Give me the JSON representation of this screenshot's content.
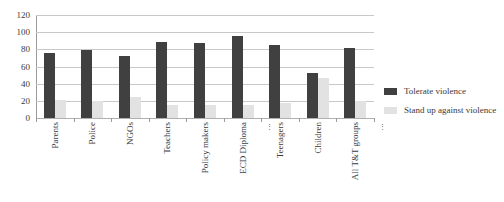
{
  "chart_data": {
    "type": "bar",
    "title": "",
    "subtitle": "",
    "xlabel": "",
    "ylabel": "",
    "ylim": [
      0,
      120
    ],
    "yticks": [
      0,
      20,
      40,
      60,
      80,
      100,
      120
    ],
    "grid": true,
    "legend_position": "right",
    "categories": [
      "Parents",
      "Police",
      "NGOs",
      "Teachers",
      "Policy makers",
      "ECD Diploma",
      "Teenagers",
      "Children",
      "All T&T groups"
    ],
    "category_marks": [
      "",
      "",
      "",
      "",
      "",
      "⋮",
      "",
      "",
      "⋮"
    ],
    "series": [
      {
        "name": "Tolerate violence",
        "color": "#404040",
        "values": [
          76,
          79,
          72,
          89,
          87,
          96,
          85,
          53,
          81
        ]
      },
      {
        "name": "Stand up against violence",
        "color": "#e2e2e2",
        "values": [
          21,
          20,
          25,
          15,
          15,
          15,
          18,
          47,
          20
        ]
      }
    ]
  },
  "axes": {
    "y_tick_labels": [
      "120",
      "100",
      "80",
      "60",
      "40",
      "20",
      "0"
    ]
  },
  "legend": {
    "items": [
      {
        "label": "Tolerate violence",
        "swatch": "dark"
      },
      {
        "label": "Stand up against violence",
        "swatch": "light"
      }
    ]
  }
}
